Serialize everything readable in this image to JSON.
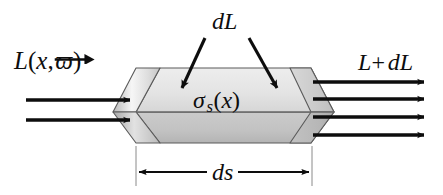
{
  "figure": {
    "background_color": "#ffffff",
    "ink_color": "#0d0d0d",
    "width": 443,
    "height": 195
  },
  "labels": {
    "incident_radiance": {
      "name": "incident-radiance-label",
      "L": "L",
      "open_paren": "(",
      "x": "x",
      "comma": ",",
      "omega": "ϖ",
      "close_paren": ")",
      "plain_text": "L(x, ω⃗)"
    },
    "exitant_radiance": {
      "name": "exitant-radiance-label",
      "L": "L",
      "plus": "+",
      "dL": "dL",
      "plain_text": "L+ dL"
    },
    "differential_radiance": {
      "name": "differential-radiance-label",
      "text": "dL"
    },
    "scattering_coefficient": {
      "name": "scattering-coefficient-label",
      "sigma": "σ",
      "subscript": "s",
      "open_paren": "(",
      "x": "x",
      "close_paren": ")",
      "plain_text": "σ_s(x)"
    },
    "path_length": {
      "name": "path-length-label",
      "text": "ds"
    }
  },
  "prism": {
    "name": "scattering-volume-prism",
    "top_face_fill_light": "#e6e6e6",
    "top_face_fill_dark": "#d2d2d2",
    "bottom_face_fill_light": "#c9c9c9",
    "bottom_face_fill_dark": "#b5b5b5",
    "cap_fill_light": "#f4f4f4",
    "cap_fill_dark": "#bdbdbd",
    "stroke_color": "#4a4a4a",
    "stroke_width": 1.1
  },
  "rays": {
    "incident": {
      "name": "incident-ray-arrows",
      "count": 2,
      "direction": "right",
      "y_positions": [
        100,
        120
      ],
      "x_start": 26,
      "x_end": 135
    },
    "exitant": {
      "name": "exitant-ray-arrows",
      "count": 4,
      "direction": "right",
      "y_positions": [
        82,
        99,
        117,
        135
      ],
      "x_start": 326,
      "x_end": 430
    },
    "scatter_pointers": {
      "name": "scatter-pointer-arrows",
      "count": 2,
      "description": "two diagonal arrows from the dL label into the prism top face"
    }
  },
  "dimension": {
    "name": "path-length-dimension",
    "style": "double-headed-arrow",
    "y": 172,
    "x_left": 136,
    "x_right": 312,
    "extension_top": 146
  }
}
